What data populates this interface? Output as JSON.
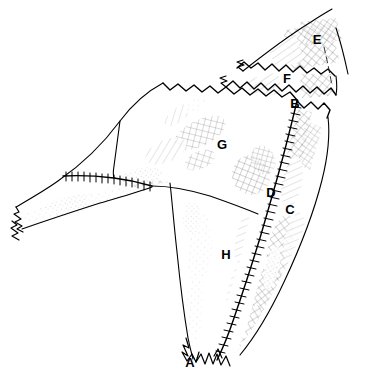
{
  "figure": {
    "kind": "scientific line illustration",
    "background_color": "#ffffff",
    "ink_color": "#000000",
    "width": 366,
    "height": 377,
    "labels": [
      {
        "id": "A",
        "text": "A",
        "x": 190,
        "y": 367,
        "region": "lower-broken-tip"
      },
      {
        "id": "B",
        "text": "B",
        "x": 295,
        "y": 108,
        "region": "upper-suture-junction"
      },
      {
        "id": "C",
        "text": "C",
        "x": 290,
        "y": 214,
        "region": "right-lateral-blade"
      },
      {
        "id": "D",
        "text": "D",
        "x": 271,
        "y": 197,
        "region": "mid-suture-ridge"
      },
      {
        "id": "E",
        "text": "E",
        "x": 317,
        "y": 44,
        "region": "upper-right-hatched-plate"
      },
      {
        "id": "F",
        "text": "F",
        "x": 287,
        "y": 83,
        "region": "upper-middle-plate"
      },
      {
        "id": "G",
        "text": "G",
        "x": 222,
        "y": 149,
        "region": "large-dorsal-plate"
      },
      {
        "id": "H",
        "text": "H",
        "x": 226,
        "y": 259,
        "region": "ventral-shaft"
      }
    ],
    "strokes": {
      "outline_width": 1.1,
      "suture_width": 1.4,
      "style": "pen-and-ink with stipple and cross-hatch shading"
    }
  }
}
